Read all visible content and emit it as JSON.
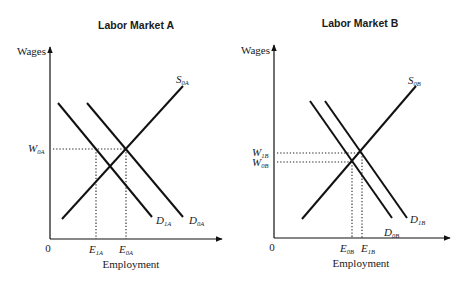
{
  "panels": [
    {
      "id": "A",
      "title": "Labor Market A",
      "y_axis_label": "Wages",
      "x_axis_label": "Employment",
      "origin_label": "0",
      "curves": {
        "supply": {
          "base": "S",
          "sub": "0A"
        },
        "demand_initial": {
          "base": "D",
          "sub": "0A"
        },
        "demand_new": {
          "base": "D",
          "sub": "1A"
        }
      },
      "wage_labels": [
        {
          "base": "W",
          "sub": "0A"
        }
      ],
      "employment_labels": [
        {
          "base": "E",
          "sub": "1A"
        },
        {
          "base": "E",
          "sub": "0A"
        }
      ]
    },
    {
      "id": "B",
      "title": "Labor Market B",
      "y_axis_label": "Wages",
      "x_axis_label": "Employment",
      "origin_label": "0",
      "curves": {
        "supply": {
          "base": "S",
          "sub": "0B"
        },
        "demand_initial": {
          "base": "D",
          "sub": "0B"
        },
        "demand_new": {
          "base": "D",
          "sub": "1B"
        }
      },
      "wage_labels": [
        {
          "base": "W",
          "sub": "1B"
        },
        {
          "base": "W",
          "sub": "0B"
        }
      ],
      "employment_labels": [
        {
          "base": "E",
          "sub": "0B"
        },
        {
          "base": "E",
          "sub": "1B"
        }
      ]
    }
  ]
}
